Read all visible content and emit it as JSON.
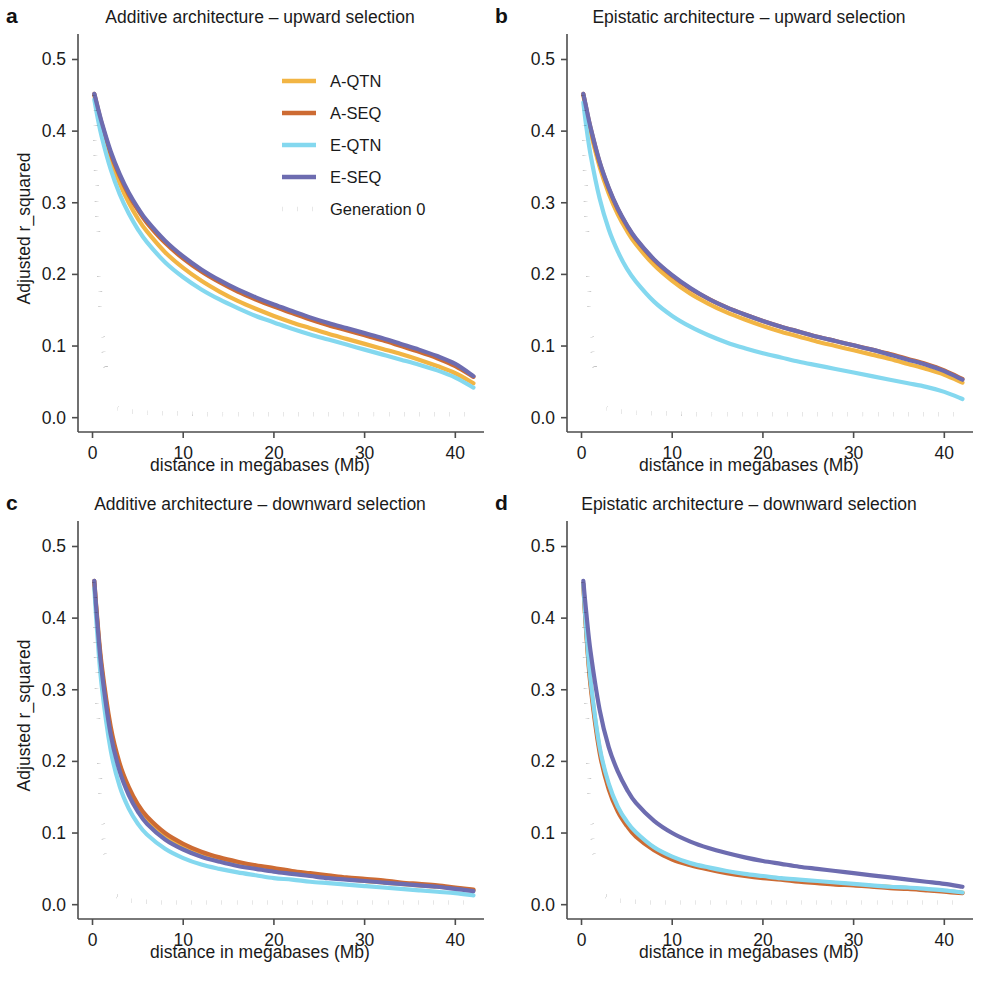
{
  "figure": {
    "background": "#ffffff",
    "axis_color": "#4d4d4d",
    "text_color": "#1a1a1a"
  },
  "axes": {
    "x": {
      "label": "distance in megabases (Mb)",
      "ticks": [
        0,
        10,
        20,
        30,
        40
      ],
      "tick_labels": [
        "0",
        "10",
        "20",
        "30",
        "40"
      ],
      "lim": [
        -1.6,
        42.5
      ]
    },
    "y": {
      "label": "Adjusted r_squared",
      "ticks": [
        0.0,
        0.1,
        0.2,
        0.3,
        0.4,
        0.5
      ],
      "tick_labels": [
        "0.0",
        "0.1",
        "0.2",
        "0.3",
        "0.4",
        "0.5"
      ],
      "lim": [
        -0.02,
        0.53
      ]
    }
  },
  "legend": {
    "position": "top-right of panel a",
    "entries": [
      {
        "label": "A-QTN",
        "color": "#f2b544",
        "style": "solid"
      },
      {
        "label": "A-SEQ",
        "color": "#cd6b33",
        "style": "solid"
      },
      {
        "label": "E-QTN",
        "color": "#84d8ef",
        "style": "solid"
      },
      {
        "label": "E-SEQ",
        "color": "#6d6cb0",
        "style": "solid"
      },
      {
        "label": "Generation 0",
        "color": "#111111",
        "style": "dotted"
      }
    ]
  },
  "panels": [
    {
      "letter": "a",
      "title": "Additive architecture – upward selection"
    },
    {
      "letter": "b",
      "title": "Epistatic architecture – upward selection"
    },
    {
      "letter": "c",
      "title": "Additive architecture – downward selection"
    },
    {
      "letter": "d",
      "title": "Epistatic architecture – downward selection"
    }
  ],
  "chart_data": [
    {
      "panel": "a",
      "type": "line",
      "title": "Additive architecture – upward selection",
      "xlabel": "distance in megabases (Mb)",
      "ylabel": "Adjusted r_squared",
      "xlim": [
        -1.6,
        42.5
      ],
      "ylim": [
        -0.02,
        0.53
      ],
      "grid": false,
      "x": [
        0.2,
        0.5,
        1,
        2,
        3,
        4,
        5,
        6,
        8,
        10,
        12,
        14,
        16,
        18,
        20,
        22,
        24,
        26,
        28,
        30,
        32,
        34,
        36,
        38,
        40,
        42
      ],
      "series": [
        {
          "name": "A-QTN",
          "color": "#f2b544",
          "values": [
            0.45,
            0.432,
            0.405,
            0.361,
            0.327,
            0.3,
            0.278,
            0.26,
            0.231,
            0.209,
            0.191,
            0.176,
            0.163,
            0.152,
            0.142,
            0.133,
            0.125,
            0.117,
            0.11,
            0.103,
            0.096,
            0.089,
            0.081,
            0.072,
            0.062,
            0.048
          ]
        },
        {
          "name": "A-SEQ",
          "color": "#cd6b33",
          "values": [
            0.452,
            0.436,
            0.411,
            0.369,
            0.337,
            0.311,
            0.29,
            0.272,
            0.244,
            0.222,
            0.204,
            0.189,
            0.176,
            0.165,
            0.155,
            0.146,
            0.137,
            0.129,
            0.122,
            0.115,
            0.108,
            0.1,
            0.092,
            0.083,
            0.072,
            0.057
          ]
        },
        {
          "name": "E-QTN",
          "color": "#84d8ef",
          "values": [
            0.444,
            0.423,
            0.393,
            0.347,
            0.312,
            0.285,
            0.263,
            0.245,
            0.217,
            0.196,
            0.179,
            0.165,
            0.153,
            0.142,
            0.133,
            0.124,
            0.116,
            0.109,
            0.102,
            0.095,
            0.088,
            0.081,
            0.074,
            0.066,
            0.056,
            0.042
          ]
        },
        {
          "name": "E-SEQ",
          "color": "#6d6cb0",
          "values": [
            0.452,
            0.437,
            0.413,
            0.372,
            0.34,
            0.314,
            0.293,
            0.275,
            0.247,
            0.225,
            0.207,
            0.192,
            0.179,
            0.168,
            0.158,
            0.149,
            0.14,
            0.132,
            0.125,
            0.118,
            0.111,
            0.103,
            0.095,
            0.086,
            0.075,
            0.058
          ]
        },
        {
          "name": "Generation 0",
          "color": "#111111",
          "style": "dotted",
          "values": [
            0.45,
            0.3,
            0.13,
            0.028,
            0.012,
            0.009,
            0.008,
            0.007,
            0.006,
            0.006,
            0.005,
            0.005,
            0.005,
            0.005,
            0.005,
            0.005,
            0.005,
            0.005,
            0.005,
            0.005,
            0.005,
            0.005,
            0.005,
            0.005,
            0.005,
            0.005
          ]
        }
      ]
    },
    {
      "panel": "b",
      "type": "line",
      "title": "Epistatic architecture – upward selection",
      "xlabel": "distance in megabases (Mb)",
      "ylabel": "Adjusted r_squared",
      "xlim": [
        -1.6,
        42.5
      ],
      "ylim": [
        -0.02,
        0.53
      ],
      "grid": false,
      "x": [
        0.2,
        0.5,
        1,
        2,
        3,
        4,
        5,
        6,
        8,
        10,
        12,
        14,
        16,
        18,
        20,
        22,
        24,
        26,
        28,
        30,
        32,
        34,
        36,
        38,
        40,
        42
      ],
      "series": [
        {
          "name": "A-QTN",
          "color": "#f2b544",
          "values": [
            0.45,
            0.43,
            0.399,
            0.35,
            0.313,
            0.284,
            0.261,
            0.242,
            0.213,
            0.191,
            0.173,
            0.159,
            0.147,
            0.137,
            0.128,
            0.12,
            0.113,
            0.106,
            0.1,
            0.094,
            0.088,
            0.082,
            0.075,
            0.068,
            0.06,
            0.049
          ]
        },
        {
          "name": "A-SEQ",
          "color": "#cd6b33",
          "values": [
            0.452,
            0.433,
            0.404,
            0.356,
            0.32,
            0.291,
            0.268,
            0.249,
            0.22,
            0.198,
            0.18,
            0.166,
            0.154,
            0.144,
            0.135,
            0.127,
            0.12,
            0.113,
            0.107,
            0.101,
            0.095,
            0.089,
            0.082,
            0.075,
            0.066,
            0.054
          ]
        },
        {
          "name": "E-QTN",
          "color": "#84d8ef",
          "values": [
            0.44,
            0.409,
            0.367,
            0.306,
            0.263,
            0.232,
            0.208,
            0.19,
            0.162,
            0.142,
            0.127,
            0.115,
            0.105,
            0.097,
            0.09,
            0.084,
            0.078,
            0.073,
            0.068,
            0.063,
            0.058,
            0.053,
            0.048,
            0.043,
            0.036,
            0.026
          ]
        },
        {
          "name": "E-SEQ",
          "color": "#6d6cb0",
          "values": [
            0.452,
            0.434,
            0.405,
            0.357,
            0.321,
            0.292,
            0.269,
            0.25,
            0.221,
            0.199,
            0.181,
            0.166,
            0.154,
            0.144,
            0.135,
            0.127,
            0.12,
            0.113,
            0.107,
            0.101,
            0.095,
            0.088,
            0.081,
            0.074,
            0.065,
            0.053
          ]
        },
        {
          "name": "Generation 0",
          "color": "#111111",
          "style": "dotted",
          "values": [
            0.45,
            0.3,
            0.13,
            0.028,
            0.012,
            0.009,
            0.008,
            0.007,
            0.006,
            0.006,
            0.005,
            0.005,
            0.005,
            0.005,
            0.005,
            0.005,
            0.005,
            0.005,
            0.005,
            0.005,
            0.005,
            0.005,
            0.005,
            0.005,
            0.005,
            0.005
          ]
        }
      ]
    },
    {
      "panel": "c",
      "type": "line",
      "title": "Additive architecture – downward selection",
      "xlabel": "distance in megabases (Mb)",
      "ylabel": "Adjusted r_squared",
      "xlim": [
        -1.6,
        42.5
      ],
      "ylim": [
        -0.02,
        0.53
      ],
      "grid": false,
      "x": [
        0.2,
        0.5,
        1,
        2,
        3,
        4,
        5,
        6,
        8,
        10,
        12,
        14,
        16,
        18,
        20,
        22,
        24,
        26,
        28,
        30,
        32,
        34,
        36,
        38,
        40,
        42
      ],
      "series": [
        {
          "name": "A-QTN",
          "color": "#f2b544",
          "values": [
            0.448,
            0.398,
            0.33,
            0.243,
            0.192,
            0.159,
            0.136,
            0.119,
            0.096,
            0.081,
            0.071,
            0.063,
            0.057,
            0.052,
            0.048,
            0.044,
            0.041,
            0.038,
            0.036,
            0.033,
            0.031,
            0.029,
            0.027,
            0.025,
            0.023,
            0.02
          ]
        },
        {
          "name": "A-SEQ",
          "color": "#cd6b33",
          "values": [
            0.452,
            0.403,
            0.336,
            0.249,
            0.197,
            0.164,
            0.14,
            0.123,
            0.1,
            0.085,
            0.074,
            0.066,
            0.06,
            0.055,
            0.051,
            0.047,
            0.044,
            0.041,
            0.038,
            0.036,
            0.034,
            0.031,
            0.029,
            0.027,
            0.024,
            0.021
          ]
        },
        {
          "name": "E-QTN",
          "color": "#84d8ef",
          "values": [
            0.442,
            0.383,
            0.307,
            0.216,
            0.165,
            0.134,
            0.113,
            0.098,
            0.078,
            0.065,
            0.056,
            0.05,
            0.045,
            0.041,
            0.037,
            0.035,
            0.032,
            0.03,
            0.028,
            0.026,
            0.024,
            0.022,
            0.02,
            0.018,
            0.016,
            0.013
          ]
        },
        {
          "name": "E-SEQ",
          "color": "#6d6cb0",
          "values": [
            0.452,
            0.399,
            0.328,
            0.238,
            0.186,
            0.153,
            0.13,
            0.113,
            0.091,
            0.077,
            0.067,
            0.06,
            0.054,
            0.05,
            0.046,
            0.043,
            0.04,
            0.037,
            0.035,
            0.033,
            0.031,
            0.029,
            0.027,
            0.025,
            0.022,
            0.019
          ]
        },
        {
          "name": "Generation 0",
          "color": "#111111",
          "style": "dotted",
          "values": [
            0.45,
            0.3,
            0.13,
            0.028,
            0.01,
            0.006,
            0.005,
            0.004,
            0.003,
            0.003,
            0.003,
            0.003,
            0.003,
            0.003,
            0.003,
            0.003,
            0.003,
            0.003,
            0.003,
            0.003,
            0.003,
            0.003,
            0.003,
            0.003,
            0.003,
            0.003
          ]
        }
      ]
    },
    {
      "panel": "d",
      "type": "line",
      "title": "Epistatic architecture – downward selection",
      "xlabel": "distance in megabases (Mb)",
      "ylabel": "Adjusted r_squared",
      "xlim": [
        -1.6,
        42.5
      ],
      "ylim": [
        -0.02,
        0.53
      ],
      "grid": false,
      "x": [
        0.2,
        0.5,
        1,
        2,
        3,
        4,
        5,
        6,
        8,
        10,
        12,
        14,
        16,
        18,
        20,
        22,
        24,
        26,
        28,
        30,
        32,
        34,
        36,
        38,
        40,
        42
      ],
      "series": [
        {
          "name": "A-QTN",
          "color": "#f2b544",
          "values": [
            0.446,
            0.386,
            0.31,
            0.217,
            0.166,
            0.135,
            0.114,
            0.099,
            0.079,
            0.066,
            0.057,
            0.051,
            0.046,
            0.042,
            0.039,
            0.036,
            0.034,
            0.032,
            0.03,
            0.028,
            0.026,
            0.025,
            0.023,
            0.021,
            0.019,
            0.017
          ]
        },
        {
          "name": "A-SEQ",
          "color": "#cd6b33",
          "values": [
            0.448,
            0.384,
            0.305,
            0.212,
            0.161,
            0.13,
            0.11,
            0.095,
            0.076,
            0.063,
            0.055,
            0.049,
            0.044,
            0.04,
            0.037,
            0.035,
            0.032,
            0.03,
            0.028,
            0.027,
            0.025,
            0.023,
            0.022,
            0.02,
            0.018,
            0.016
          ]
        },
        {
          "name": "E-QTN",
          "color": "#84d8ef",
          "values": [
            0.447,
            0.388,
            0.313,
            0.22,
            0.169,
            0.137,
            0.116,
            0.101,
            0.08,
            0.067,
            0.058,
            0.052,
            0.047,
            0.043,
            0.04,
            0.037,
            0.035,
            0.033,
            0.031,
            0.029,
            0.027,
            0.025,
            0.024,
            0.022,
            0.02,
            0.017
          ]
        },
        {
          "name": "E-SEQ",
          "color": "#6d6cb0",
          "values": [
            0.452,
            0.411,
            0.353,
            0.272,
            0.22,
            0.186,
            0.161,
            0.142,
            0.117,
            0.1,
            0.088,
            0.079,
            0.072,
            0.066,
            0.061,
            0.057,
            0.053,
            0.05,
            0.047,
            0.044,
            0.041,
            0.038,
            0.035,
            0.032,
            0.029,
            0.025
          ]
        },
        {
          "name": "Generation 0",
          "color": "#111111",
          "style": "dotted",
          "values": [
            0.45,
            0.3,
            0.13,
            0.028,
            0.01,
            0.006,
            0.005,
            0.004,
            0.003,
            0.003,
            0.003,
            0.003,
            0.003,
            0.003,
            0.003,
            0.003,
            0.003,
            0.003,
            0.003,
            0.003,
            0.003,
            0.003,
            0.003,
            0.003,
            0.003,
            0.003
          ]
        }
      ]
    }
  ]
}
